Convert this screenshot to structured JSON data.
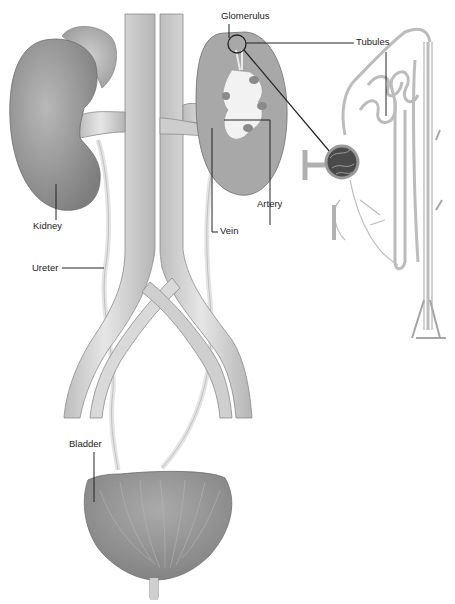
{
  "diagram": {
    "labels": {
      "glomerulus": "Glomerulus",
      "tubules": "Tubules",
      "kidney": "Kidney",
      "artery": "Artery",
      "vein": "Vein",
      "ureter": "Ureter",
      "bladder": "Bladder"
    },
    "colors": {
      "organ_fill": "#9a9a9a",
      "vessel_fill": "#d2d2d2",
      "vessel_edge": "#8c8c8c",
      "cortex_fill": "#a8a8a8",
      "medulla_fill": "#f2f2f2",
      "leader_line": "#222222",
      "glomerulus_fill": "#4a4a4a"
    }
  }
}
